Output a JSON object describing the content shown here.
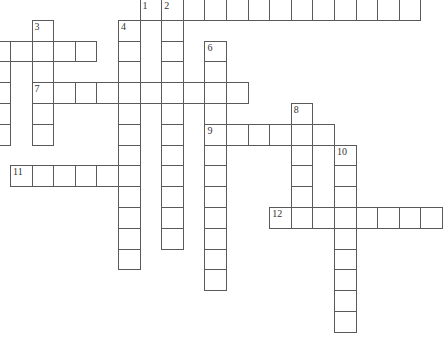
{
  "puzzle": {
    "type": "crossword",
    "cell_w": 21.6,
    "cell_h": 20.8,
    "origin_x": 10,
    "origin_y": -1,
    "line_color": "#5a5a5a",
    "words": [
      {
        "label": "1",
        "dir": "across",
        "row": 0,
        "col": 6,
        "len": 13
      },
      {
        "label": "2",
        "dir": "down",
        "row": 0,
        "col": 7,
        "len": 12
      },
      {
        "label": "3",
        "dir": "down",
        "row": 1,
        "col": 1,
        "len": 6
      },
      {
        "label": "4",
        "dir": "down",
        "row": 1,
        "col": 5,
        "len": 12
      },
      {
        "label": "",
        "dir": "across",
        "row": 2,
        "col": -1,
        "len": 5
      },
      {
        "label": "",
        "dir": "down",
        "row": 2,
        "col": -1,
        "len": 5
      },
      {
        "label": "6",
        "dir": "down",
        "row": 2,
        "col": 9,
        "len": 12
      },
      {
        "label": "7",
        "dir": "across",
        "row": 4,
        "col": 1,
        "len": 10
      },
      {
        "label": "8",
        "dir": "down",
        "row": 5,
        "col": 13,
        "len": 6
      },
      {
        "label": "9",
        "dir": "across",
        "row": 6,
        "col": 9,
        "len": 6
      },
      {
        "label": "10",
        "dir": "down",
        "row": 7,
        "col": 15,
        "len": 9
      },
      {
        "label": "11",
        "dir": "across",
        "row": 8,
        "col": 0,
        "len": 6
      },
      {
        "label": "12",
        "dir": "across",
        "row": 10,
        "col": 12,
        "len": 8
      }
    ]
  }
}
